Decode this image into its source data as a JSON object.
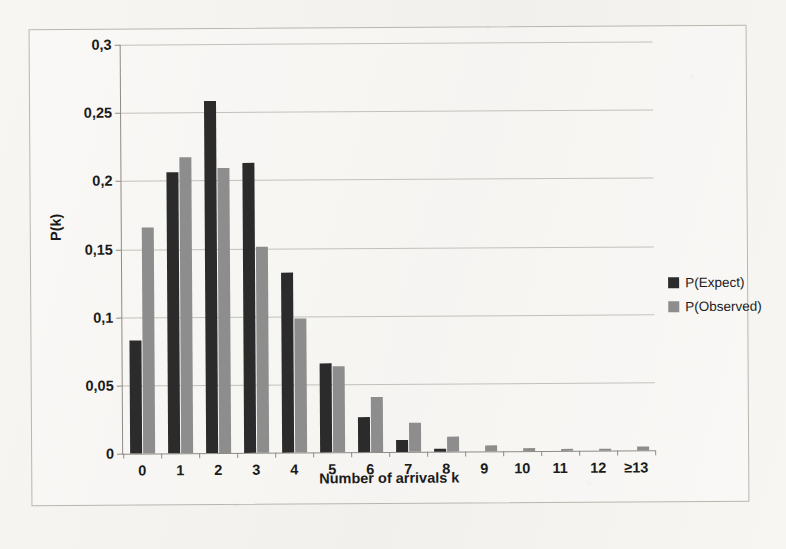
{
  "chart_data": {
    "type": "bar",
    "title": "",
    "xlabel": "Number of arrivals k",
    "ylabel": "P(k)",
    "categories": [
      "0",
      "1",
      "2",
      "3",
      "4",
      "5",
      "6",
      "7",
      "8",
      "9",
      "10",
      "11",
      "12",
      "≥13"
    ],
    "series": [
      {
        "name": "P(Expect)",
        "color": "#2b2b2b",
        "values": [
          0.083,
          0.206,
          0.258,
          0.213,
          0.132,
          0.065,
          0.026,
          0.009,
          0.002,
          0.0,
          0.0,
          0.0,
          0.0,
          0.0
        ]
      },
      {
        "name": "P(Observed)",
        "color": "#8d8d8d",
        "values": [
          0.166,
          0.217,
          0.209,
          0.151,
          0.098,
          0.063,
          0.04,
          0.021,
          0.011,
          0.0045,
          0.002,
          0.0015,
          0.0012,
          0.003
        ]
      }
    ],
    "ylim": [
      0,
      0.3
    ],
    "yticks": [
      0,
      0.05,
      0.1,
      0.15,
      0.2,
      0.25,
      0.3
    ],
    "ytick_labels": [
      "0",
      "0,05",
      "0,1",
      "0,15",
      "0,2",
      "0,25",
      "0,3"
    ],
    "grid": true,
    "legend_position": "right",
    "decimal_separator": ","
  },
  "legend": {
    "items": [
      {
        "label": "P(Expect)"
      },
      {
        "label": "P(Observed)"
      }
    ]
  }
}
